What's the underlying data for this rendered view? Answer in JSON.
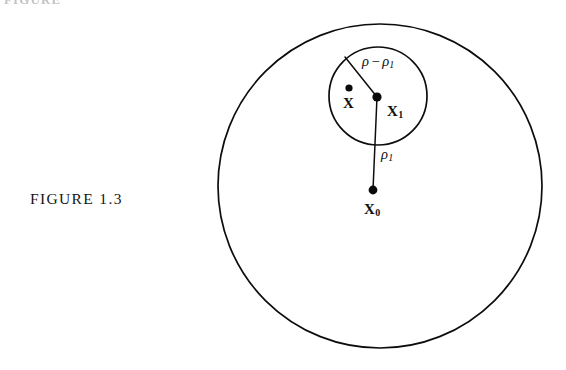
{
  "page": {
    "width": 566,
    "height": 370,
    "background": "#ffffff",
    "ink_color": "#0d0d0d",
    "top_cut_text": "FIGURE"
  },
  "caption": {
    "text": "FIGURE 1.3"
  },
  "chart_data": {
    "type": "diagram",
    "title": "FIGURE 1.3",
    "shapes": [
      {
        "name": "outer-circle",
        "kind": "circle",
        "cx": 380,
        "cy": 186,
        "r": 162,
        "stroke": "#0d0d0d",
        "stroke_width": 1.7,
        "fill": "none"
      },
      {
        "name": "inner-circle",
        "kind": "circle",
        "cx": 378,
        "cy": 96,
        "r": 49,
        "stroke": "#0d0d0d",
        "stroke_width": 1.7,
        "fill": "none"
      }
    ],
    "points": [
      {
        "name": "X",
        "label": "X",
        "subscript": "",
        "cx": 349,
        "cy": 88,
        "r": 3.6,
        "label_x": 349,
        "label_y": 104
      },
      {
        "name": "X1",
        "label": "X",
        "subscript": "1",
        "cx": 377,
        "cy": 97,
        "r": 4.6,
        "label_x": 399,
        "label_y": 113
      },
      {
        "name": "X0",
        "label": "X",
        "subscript": "0",
        "cx": 373,
        "cy": 190,
        "r": 4.4,
        "label_x": 373,
        "label_y": 211
      }
    ],
    "segments": [
      {
        "name": "radius-rho-minus-rho1",
        "from": [
          377,
          97
        ],
        "to": [
          345,
          57
        ],
        "label": "ρ − ρ₁",
        "label_x": 389,
        "label_y": 62,
        "stroke_width": 1.5
      },
      {
        "name": "radius-rho1",
        "from": [
          377,
          97
        ],
        "to": [
          373,
          190
        ],
        "label": "ρ₁",
        "label_x": 383,
        "label_y": 155,
        "stroke_width": 1.5
      }
    ],
    "labels": [
      {
        "name": "label-rho-minus-rho1",
        "rho": "ρ",
        "minus": "−",
        "rho_sub_base": "ρ",
        "rho_sub": "1"
      },
      {
        "name": "label-rho1",
        "rho_base": "ρ",
        "rho_sub": "1"
      },
      {
        "name": "label-x",
        "base": "X",
        "sub": ""
      },
      {
        "name": "label-x1",
        "base": "X",
        "sub": "1"
      },
      {
        "name": "label-x0",
        "base": "X",
        "sub": "0"
      }
    ]
  }
}
